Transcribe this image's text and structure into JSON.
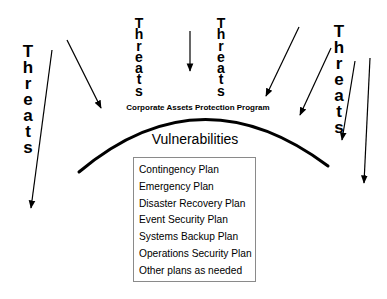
{
  "diagram": {
    "threat_label": "Threats",
    "threat_labels": [
      {
        "id": "left",
        "text": "Threats"
      },
      {
        "id": "center-left",
        "text": "Threats"
      },
      {
        "id": "center-right",
        "text": "Threats"
      },
      {
        "id": "right",
        "text": "Threats"
      }
    ],
    "caption": "Corporate Assets Protection Program",
    "vulnerabilities_title": "Vulnerabilities",
    "plans": [
      "Contingency Plan",
      "Emergency Plan",
      "Disaster Recovery Plan",
      "Event Security Plan",
      "Systems Backup Plan",
      "Operations Security Plan",
      "Other plans as needed"
    ],
    "arrows": [
      {
        "from": [
          52,
          50
        ],
        "to": [
          31,
          208
        ]
      },
      {
        "from": [
          67,
          40
        ],
        "to": [
          101,
          108
        ]
      },
      {
        "from": [
          190,
          31
        ],
        "to": [
          190,
          71
        ]
      },
      {
        "from": [
          299,
          27
        ],
        "to": [
          266,
          96
        ]
      },
      {
        "from": [
          331,
          48
        ],
        "to": [
          300,
          115
        ]
      },
      {
        "from": [
          355,
          61
        ],
        "to": [
          342,
          140
        ]
      },
      {
        "from": [
          370,
          58
        ],
        "to": [
          364,
          183
        ]
      }
    ],
    "colors": {
      "ink": "#000000",
      "box_border": "#8a8a8a",
      "background": "#ffffff"
    }
  }
}
